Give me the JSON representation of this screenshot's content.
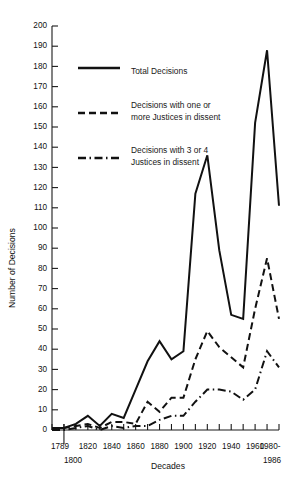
{
  "chart_data": {
    "type": "line",
    "title": "",
    "xlabel": "Decades",
    "ylabel": "Number of Decisions",
    "ylim": [
      0,
      200
    ],
    "ytick_step": 10,
    "grid": false,
    "legend_position": "upper-left-inside",
    "x_axis_start_label": "1789",
    "x_axis_start_sublabel": "1800",
    "x_axis_end_label": "1980-",
    "x_axis_end_sublabel": "1986",
    "categories": [
      "1789",
      "1800",
      "1810",
      "1820",
      "1830",
      "1840",
      "1850",
      "1860",
      "1870",
      "1880",
      "1890",
      "1900",
      "1910",
      "1920",
      "1930",
      "1940",
      "1950",
      "1960",
      "1970",
      "1980-1986"
    ],
    "xticks": [
      "1789",
      "1800",
      "1820",
      "1840",
      "1860",
      "1880",
      "1900",
      "1920",
      "1940",
      "1960",
      "1980-1986"
    ],
    "yticks": [
      0,
      10,
      20,
      30,
      40,
      50,
      60,
      70,
      80,
      90,
      100,
      110,
      120,
      130,
      140,
      150,
      160,
      170,
      180,
      190,
      200
    ],
    "series": [
      {
        "name": "Total Decisions",
        "style": "solid",
        "values": [
          1,
          1,
          3,
          7,
          2,
          8,
          6,
          20,
          34,
          44,
          35,
          39,
          117,
          136,
          89,
          57,
          55,
          152,
          188,
          111
        ]
      },
      {
        "name": "Decisions with one or more Justices in dissent",
        "style": "dashed",
        "values": [
          0,
          1,
          2,
          3,
          1,
          4,
          4,
          3,
          14,
          9,
          16,
          16,
          35,
          49,
          41,
          36,
          31,
          60,
          85,
          55
        ]
      },
      {
        "name": "Decisions with 3 or 4 Justices in dissent",
        "style": "dash-dot",
        "values": [
          0,
          0,
          1,
          2,
          0,
          2,
          1,
          2,
          2,
          5,
          7,
          7,
          14,
          20,
          20,
          19,
          15,
          20,
          39,
          31
        ]
      }
    ],
    "legend": [
      {
        "label_line1": "Total Decisions",
        "label_line2": "",
        "style": "solid"
      },
      {
        "label_line1": "Decisions with one or",
        "label_line2": "more Justices in dissent",
        "style": "dashed"
      },
      {
        "label_line1": "Decisions with 3 or 4",
        "label_line2": "Justices in dissent",
        "style": "dash-dot"
      }
    ]
  },
  "colors": {
    "ink": "#111111",
    "background": "#ffffff"
  }
}
